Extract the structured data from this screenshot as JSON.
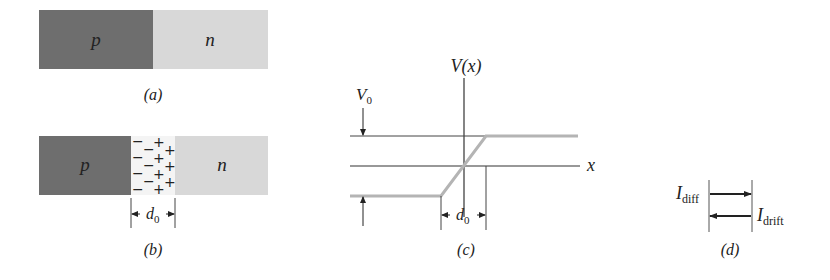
{
  "figure": {
    "panel_a": {
      "caption": "(a)",
      "p_label": "p",
      "n_label": "n",
      "colors": {
        "p": "#6e6e6e",
        "n": "#d6d6d6"
      }
    },
    "panel_b": {
      "caption": "(b)",
      "p_label": "p",
      "n_label": "n",
      "depletion_width_label": "d",
      "depletion_width_sub": "0",
      "negative_charge": "−",
      "positive_charge": "+"
    },
    "panel_c": {
      "caption": "(c)",
      "y_axis_label": "V(x)",
      "x_axis_label": "x",
      "potential_label": "V",
      "potential_sub": "0",
      "width_label": "d",
      "width_sub": "0",
      "curve_color": "#b4b4b4"
    },
    "panel_d": {
      "caption": "(d)",
      "diffusion_current": "I",
      "diffusion_sub": "diff",
      "drift_current": "I",
      "drift_sub": "drift"
    }
  }
}
